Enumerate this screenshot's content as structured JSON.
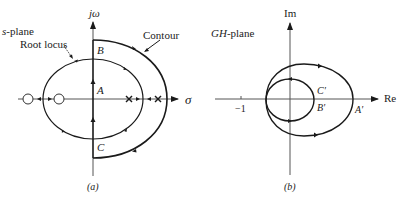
{
  "figure_a": {
    "caption": "(a)",
    "plane_label_var": "s",
    "plane_label_rest": "-plane",
    "vertical_axis": "jω",
    "horizontal_axis": "σ",
    "callouts": {
      "root_locus": "Root locus",
      "contour": "Contour"
    },
    "points": {
      "A": "A",
      "B": "B",
      "C": "C"
    },
    "zeros_count": 2,
    "poles_count": 2
  },
  "figure_b": {
    "caption": "(b)",
    "plane_label_var": "GH",
    "plane_label_rest": "-plane",
    "vertical_axis": "Im",
    "horizontal_axis": "Re",
    "tick_label": "−1",
    "points": {
      "A": "A′",
      "B": "B′",
      "C": "C′"
    }
  },
  "colors": {
    "curve": "#1a1a1a",
    "axis": "#444444",
    "text": "#222222"
  }
}
